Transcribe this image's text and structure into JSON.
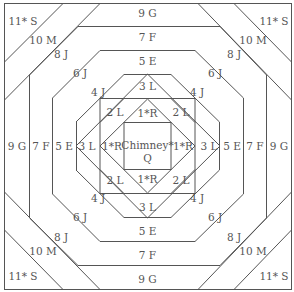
{
  "diagram": {
    "type": "quilt-block-piecing-diagram",
    "colors": {
      "line": "#555555",
      "text": "#555555",
      "background": "#ffffff"
    },
    "center": {
      "label_line1": "Chimney*",
      "label_line2": "Q"
    },
    "labels": {
      "r1_top": "1*R",
      "r1_left": "1*R",
      "r1_right": "1*R",
      "r1_bottom": "1*R",
      "l2_tl": "2 L",
      "l2_tr": "2 L",
      "l2_bl": "2 L",
      "l2_br": "2 L",
      "l3_top": "3 L",
      "l3_left": "3 L",
      "l3_right": "3 L",
      "l3_bottom": "3 L",
      "j4_tl": "4 J",
      "j4_tr": "4 J",
      "j4_bl": "4 J",
      "j4_br": "4 J",
      "e5_top": "5 E",
      "e5_left": "5 E",
      "e5_right": "5 E",
      "e5_bottom": "5 E",
      "j6_tl": "6 J",
      "j6_tr": "6 J",
      "j6_bl": "6 J",
      "j6_br": "6 J",
      "f7_top": "7 F",
      "f7_left": "7 F",
      "f7_right": "7 F",
      "f7_bottom": "7 F",
      "j8_tl": "8 J",
      "j8_tr": "8 J",
      "j8_bl": "8 J",
      "j8_br": "8 J",
      "g9_top": "9 G",
      "g9_left": "9 G",
      "g9_right": "9 G",
      "g9_bottom": "9 G",
      "m10_tl": "10 M",
      "m10_tr": "10 M",
      "m10_bl": "10 M",
      "m10_br": "10 M",
      "s11_tl": "11* S",
      "s11_tr": "11* S",
      "s11_bl": "11* S",
      "s11_br": "11* S"
    }
  }
}
